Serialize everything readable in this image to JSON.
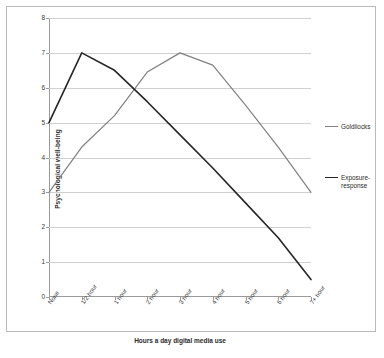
{
  "chart_data": {
    "type": "line",
    "title": "",
    "xlabel": "Hours a day digital media use",
    "ylabel": "Psychological well-being",
    "categories": [
      "None",
      "1/2 hour",
      "1 hour",
      "2 hour",
      "3 hour",
      "4 hour",
      "5 hour",
      "6 hour",
      "7+ hour"
    ],
    "ylim": [
      0,
      8
    ],
    "yticks": [
      0,
      1,
      2,
      3,
      4,
      5,
      6,
      7,
      8
    ],
    "grid": true,
    "legend_position": "right",
    "series": [
      {
        "name": "Goldilocks",
        "color": "#808080",
        "values": [
          3,
          4.3,
          5.2,
          6.45,
          7,
          6.65,
          5.5,
          4.3,
          3
        ]
      },
      {
        "name": "Exposure-response",
        "color": "#262626",
        "values": [
          5,
          7,
          6.5,
          5.6,
          4.65,
          3.7,
          2.7,
          1.7,
          0.5
        ]
      }
    ]
  },
  "legend": {
    "entries": [
      {
        "label": "Goldilocks",
        "color": "#808080"
      },
      {
        "label": "Exposure-response",
        "color": "#262626"
      }
    ]
  },
  "axes": {
    "y_title": "Psychological well-being",
    "x_title": "Hours a day digital media use",
    "y_tick_labels": [
      "0",
      "1",
      "2",
      "3",
      "4",
      "5",
      "6",
      "7",
      "8"
    ],
    "x_tick_labels": [
      "None",
      "1/2 hour",
      "1 hour",
      "2 hour",
      "3 hour",
      "4 hour",
      "5 hour",
      "6 hour",
      "7+ hour"
    ]
  }
}
